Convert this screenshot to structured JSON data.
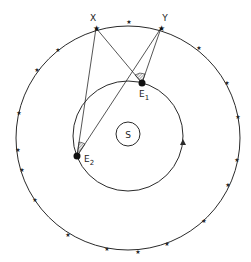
{
  "diagram": {
    "colors": {
      "stroke": "#2a2a2a",
      "background": "#ffffff"
    },
    "labels": {
      "star_x": "X",
      "star_y": "Y",
      "earth_1": "E",
      "earth_1_sub": "1",
      "earth_2": "E",
      "earth_2_sub": "2",
      "sun": "S"
    },
    "elements": {
      "outer_circle": {
        "cx": 128,
        "cy": 138,
        "r": 112,
        "meaning": "celestial sphere of distant stars"
      },
      "orbit": {
        "cx": 128,
        "cy": 136,
        "r": 55,
        "direction": "counter-clockwise arrow"
      },
      "sun": {
        "cx": 128,
        "cy": 134,
        "r": 12
      },
      "star_X": {
        "x": 96,
        "y": 28
      },
      "star_Y": {
        "x": 161,
        "y": 28
      },
      "E1": {
        "x": 142,
        "y": 83
      },
      "E2": {
        "x": 77,
        "y": 156
      }
    }
  }
}
